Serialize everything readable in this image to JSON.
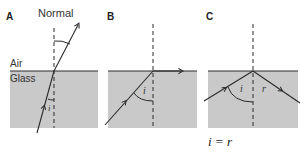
{
  "panels": [
    {
      "label": "A",
      "normal_label": "Normal",
      "air_label": "Air",
      "glass_label": "Glass",
      "angle_label": "i"
    },
    {
      "label": "B",
      "angle_label": "i"
    },
    {
      "label": "C",
      "angle_incident": "i",
      "angle_reflected": "r"
    }
  ],
  "equation": "i = r",
  "colors": {
    "glass": "#c9c9c9",
    "line": "#2a2a2a",
    "background": "#ffffff"
  }
}
